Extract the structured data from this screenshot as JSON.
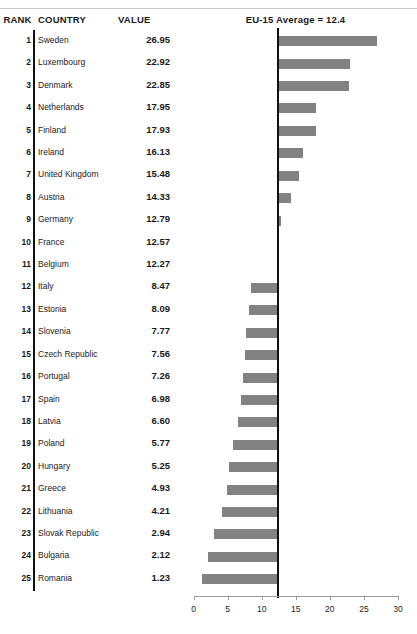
{
  "header": {
    "rank_label": "RANK",
    "country_label": "COUNTRY",
    "value_label": "VALUE",
    "chart_title": "EU-15 Average = 12.4"
  },
  "colors": {
    "bar": "#828282",
    "average_line": "#111111",
    "axis": "#9a9a9a",
    "rule": "#c9c9c9"
  },
  "chart_data": {
    "type": "bar",
    "title": "EU-15 Average = 12.4",
    "xlabel": "",
    "ylabel": "",
    "xlim": [
      0,
      30
    ],
    "xticks": [
      0,
      5,
      10,
      15,
      20,
      25,
      30
    ],
    "xtick_labels": [
      "0",
      "5",
      "10",
      "15",
      "20",
      "25",
      "30"
    ],
    "grid": false,
    "legend": null,
    "orientation": "horizontal",
    "baseline": 12.4,
    "baseline_label": "EU-15 Average = 12.4",
    "annotations": [
      "Bars are drawn as deviations from the EU-15 average of 12.4"
    ],
    "categories": [
      "Sweden",
      "Luxembourg",
      "Denmark",
      "Netherlands",
      "Finland",
      "Ireland",
      "United Kingdom",
      "Austria",
      "Germany",
      "France",
      "Belgium",
      "Italy",
      "Estonia",
      "Slovenia",
      "Czech Republic",
      "Portugal",
      "Spain",
      "Latvia",
      "Poland",
      "Hungary",
      "Greece",
      "Lithuania",
      "Slovak Republic",
      "Bulgaria",
      "Romania"
    ],
    "values": [
      26.95,
      22.92,
      22.85,
      17.95,
      17.93,
      16.13,
      15.48,
      14.33,
      12.79,
      12.57,
      12.27,
      8.47,
      8.09,
      7.77,
      7.56,
      7.26,
      6.98,
      6.6,
      5.77,
      5.25,
      4.93,
      4.21,
      2.94,
      2.12,
      1.23
    ],
    "ranks": [
      1,
      2,
      3,
      4,
      5,
      6,
      7,
      8,
      9,
      10,
      11,
      12,
      13,
      14,
      15,
      16,
      17,
      18,
      19,
      20,
      21,
      22,
      23,
      24,
      25
    ]
  },
  "rows": [
    {
      "rank": "1",
      "country": "Sweden",
      "value": "26.95",
      "v": 26.95
    },
    {
      "rank": "2",
      "country": "Luxembourg",
      "value": "22.92",
      "v": 22.92
    },
    {
      "rank": "3",
      "country": "Denmark",
      "value": "22.85",
      "v": 22.85
    },
    {
      "rank": "4",
      "country": "Netherlands",
      "value": "17.95",
      "v": 17.95
    },
    {
      "rank": "5",
      "country": "Finland",
      "value": "17.93",
      "v": 17.93
    },
    {
      "rank": "6",
      "country": "Ireland",
      "value": "16.13",
      "v": 16.13
    },
    {
      "rank": "7",
      "country": "United Kingdom",
      "value": "15.48",
      "v": 15.48
    },
    {
      "rank": "8",
      "country": "Austria",
      "value": "14.33",
      "v": 14.33
    },
    {
      "rank": "9",
      "country": "Germany",
      "value": "12.79",
      "v": 12.79
    },
    {
      "rank": "10",
      "country": "France",
      "value": "12.57",
      "v": 12.57
    },
    {
      "rank": "11",
      "country": "Belgium",
      "value": "12.27",
      "v": 12.27
    },
    {
      "rank": "12",
      "country": "Italy",
      "value": "8.47",
      "v": 8.47
    },
    {
      "rank": "13",
      "country": "Estonia",
      "value": "8.09",
      "v": 8.09
    },
    {
      "rank": "14",
      "country": "Slovenia",
      "value": "7.77",
      "v": 7.77
    },
    {
      "rank": "15",
      "country": "Czech Republic",
      "value": "7.56",
      "v": 7.56
    },
    {
      "rank": "16",
      "country": "Portugal",
      "value": "7.26",
      "v": 7.26
    },
    {
      "rank": "17",
      "country": "Spain",
      "value": "6.98",
      "v": 6.98
    },
    {
      "rank": "18",
      "country": "Latvia",
      "value": "6.60",
      "v": 6.6
    },
    {
      "rank": "19",
      "country": "Poland",
      "value": "5.77",
      "v": 5.77
    },
    {
      "rank": "20",
      "country": "Hungary",
      "value": "5.25",
      "v": 5.25
    },
    {
      "rank": "21",
      "country": "Greece",
      "value": "4.93",
      "v": 4.93
    },
    {
      "rank": "22",
      "country": "Lithuania",
      "value": "4.21",
      "v": 4.21
    },
    {
      "rank": "23",
      "country": "Slovak Republic",
      "value": "2.94",
      "v": 2.94
    },
    {
      "rank": "24",
      "country": "Bulgaria",
      "value": "2.12",
      "v": 2.12
    },
    {
      "rank": "25",
      "country": "Romania",
      "value": "1.23",
      "v": 1.23
    }
  ]
}
